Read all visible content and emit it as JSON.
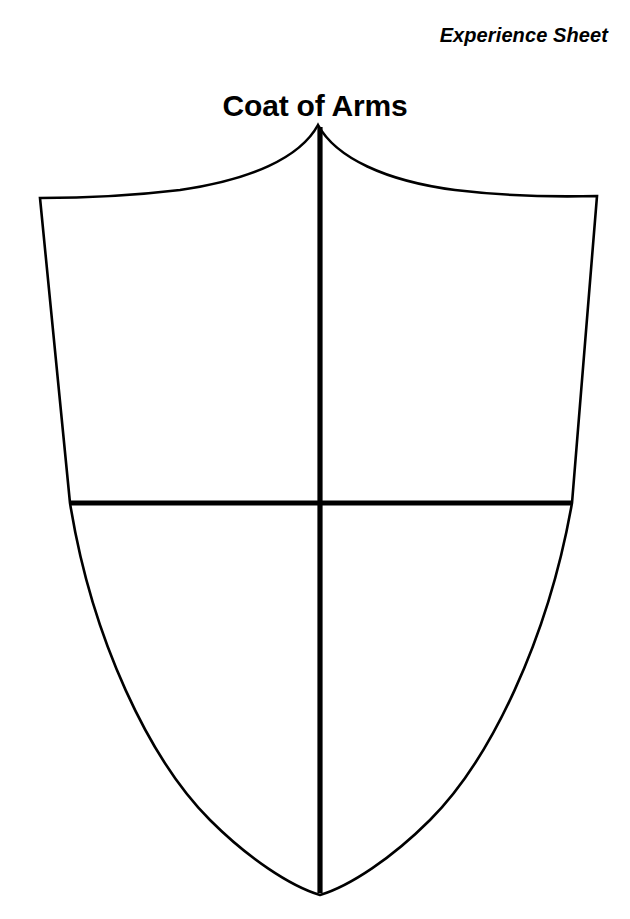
{
  "page": {
    "background_color": "#ffffff",
    "ink_color": "#000000",
    "width": 630,
    "height": 919
  },
  "header": {
    "sheet_label": "Experience Sheet",
    "title": "Coat of Arms"
  },
  "shield": {
    "name": "coat-of-arms-shield",
    "description": "Blank heraldic shield outline divided into four empty quarters by a cross",
    "fill_color": "#ffffff",
    "stroke_color": "#000000",
    "outline_stroke_width": 2.6,
    "divider_stroke_width": 5.2,
    "apex": {
      "x": 318,
      "y": 125
    },
    "top_left_corner": {
      "x": 40,
      "y": 198
    },
    "top_right_corner": {
      "x": 597,
      "y": 196
    },
    "left_shoulder": {
      "x": 70,
      "y": 503
    },
    "right_shoulder": {
      "x": 572,
      "y": 503
    },
    "bottom_point": {
      "x": 320,
      "y": 895
    },
    "outline_path": "M 318 125 C 300 158 250 180 180 190 C 130 196 78 198 40 198 L 70 503 C 92 640 150 760 210 820 C 248 858 290 886 320 895 C 350 886 392 858 430 820 C 490 760 548 640 572 503 L 597 196 C 559 197 505 196 455 190 C 386 181 336 158 318 125 Z",
    "dividers": [
      {
        "name": "fess-horizontal-divider",
        "orientation": "horizontal",
        "x1": 70,
        "y1": 503,
        "x2": 572,
        "y2": 503
      },
      {
        "name": "pale-vertical-divider",
        "orientation": "vertical",
        "x1": 320,
        "y1": 127,
        "x2": 320,
        "y2": 893
      }
    ],
    "quarters": [
      {
        "name": "quarter-top-left",
        "label": "",
        "cx": 190,
        "cy": 340
      },
      {
        "name": "quarter-top-right",
        "label": "",
        "cx": 450,
        "cy": 340
      },
      {
        "name": "quarter-bottom-left",
        "label": "",
        "cx": 210,
        "cy": 660
      },
      {
        "name": "quarter-bottom-right",
        "label": "",
        "cx": 430,
        "cy": 660
      }
    ]
  }
}
